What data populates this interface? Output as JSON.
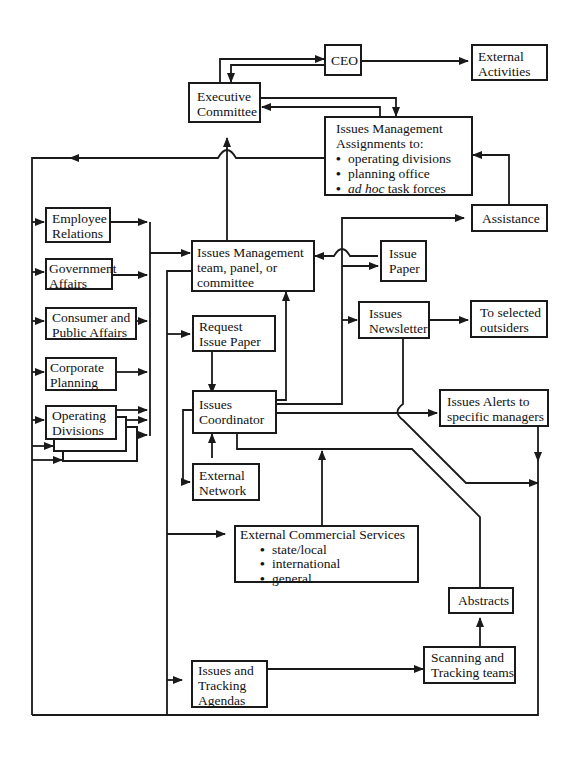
{
  "diagram": {
    "title": "",
    "nodes": {
      "ceo": {
        "lines": [
          "CEO"
        ]
      },
      "external_activities": {
        "lines": [
          "External",
          "Activities"
        ]
      },
      "executive_committee": {
        "lines": [
          "Executive",
          "Committee"
        ]
      },
      "im_assignments": {
        "lines": [
          "Issues Management",
          "Assignments to:"
        ],
        "bullets": [
          "operating divisions",
          "planning office",
          "task forces"
        ],
        "bullet3_italic": "ad hoc"
      },
      "assistance": {
        "lines": [
          "Assistance"
        ]
      },
      "employee_relations": {
        "lines": [
          "Employee",
          "Relations"
        ]
      },
      "government_affairs": {
        "lines": [
          "Government",
          "Affairs"
        ]
      },
      "consumer_public_affairs": {
        "lines": [
          "Consumer and",
          "Public Affairs"
        ]
      },
      "corporate_planning": {
        "lines": [
          "Corporate",
          "Planning"
        ]
      },
      "operating_divisions": {
        "lines": [
          "Operating",
          "Divisions"
        ]
      },
      "im_team": {
        "lines": [
          "Issues Management",
          "team, panel, or",
          "committee"
        ]
      },
      "issue_paper": {
        "lines": [
          "Issue",
          "Paper"
        ]
      },
      "request_issue_paper": {
        "lines": [
          "Request",
          "Issue Paper"
        ]
      },
      "issues_newsletter": {
        "lines": [
          "Issues",
          "Newsletter"
        ]
      },
      "selected_outsiders": {
        "lines": [
          "To selected",
          "outsiders"
        ]
      },
      "issues_coordinator": {
        "lines": [
          "Issues",
          "Coordinator"
        ]
      },
      "issues_alerts": {
        "lines": [
          "Issues Alerts to",
          "specific managers"
        ]
      },
      "external_network": {
        "lines": [
          "External",
          "Network"
        ]
      },
      "ext_commercial": {
        "lines": [
          "External Commercial Services"
        ],
        "bullets": [
          "state/local",
          "international",
          "general"
        ]
      },
      "abstracts": {
        "lines": [
          "Abstracts"
        ]
      },
      "scanning_tracking": {
        "lines": [
          "Scanning and",
          "Tracking teams"
        ]
      },
      "issues_tracking_agendas": {
        "lines": [
          "Issues and",
          "Tracking",
          "Agendas"
        ]
      }
    },
    "edges": [
      [
        "Executive Committee",
        "CEO"
      ],
      [
        "CEO",
        "Executive Committee"
      ],
      [
        "CEO",
        "External Activities"
      ],
      [
        "Executive Committee",
        "Issues Management Assignments"
      ],
      [
        "Issues Management Assignments",
        "Executive Committee"
      ],
      [
        "Issues Management Assignments",
        "Left bus"
      ],
      [
        "Assistance",
        "Issues Management Assignments"
      ],
      [
        "Left bus",
        "Employee Relations"
      ],
      [
        "Left bus",
        "Government Affairs"
      ],
      [
        "Left bus",
        "Consumer and Public Affairs"
      ],
      [
        "Left bus",
        "Corporate Planning"
      ],
      [
        "Left bus",
        "Operating Divisions"
      ],
      [
        "Staff units",
        "Issues Management team"
      ],
      [
        "Issues Management team",
        "Executive Committee"
      ],
      [
        "Issues Management team",
        "Request Issue Paper"
      ],
      [
        "Issues Management team",
        "External Commercial Services"
      ],
      [
        "Issues Management team",
        "Issues and Tracking Agendas"
      ],
      [
        "Issue Paper",
        "Issues Management team"
      ],
      [
        "Issues Coordinator",
        "Assistance"
      ],
      [
        "Issues Coordinator",
        "Issue Paper"
      ],
      [
        "Issues Coordinator",
        "Issues Newsletter"
      ],
      [
        "Issues Coordinator",
        "Issues Management team"
      ],
      [
        "Request Issue Paper",
        "Issues Coordinator"
      ],
      [
        "Issues Newsletter",
        "To selected outsiders"
      ],
      [
        "Issues Newsletter",
        "Right bus"
      ],
      [
        "Issues Coordinator",
        "Issues Alerts to specific managers"
      ],
      [
        "Issues Alerts to specific managers",
        "Right bus"
      ],
      [
        "Issues Coordinator",
        "External Network"
      ],
      [
        "External Network",
        "Issues Coordinator"
      ],
      [
        "External Commercial Services",
        "Issues Coordinator"
      ],
      [
        "Abstracts",
        "Issues Coordinator"
      ],
      [
        "Issues and Tracking Agendas",
        "Scanning and Tracking teams"
      ],
      [
        "Scanning and Tracking teams",
        "Abstracts"
      ],
      [
        "Right bus",
        "Left bus"
      ]
    ]
  }
}
